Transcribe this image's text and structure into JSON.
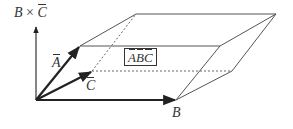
{
  "diagram": {
    "labels": {
      "cross": {
        "left": "B",
        "op": "×",
        "right": "C"
      },
      "a": "A",
      "b": "B",
      "c": "C",
      "triple": {
        "bracket_open": "[",
        "a": "A",
        "b": "B",
        "c": "C",
        "bracket_close": "]"
      }
    },
    "colors": {
      "ink": "#333333",
      "vector": "#222222",
      "background": "#ffffff"
    },
    "points": {
      "origin": [
        36,
        100
      ],
      "A": [
        80,
        46
      ],
      "B": [
        176,
        100
      ],
      "C": [
        92,
        71
      ],
      "axis_top": [
        36,
        26
      ]
    }
  }
}
